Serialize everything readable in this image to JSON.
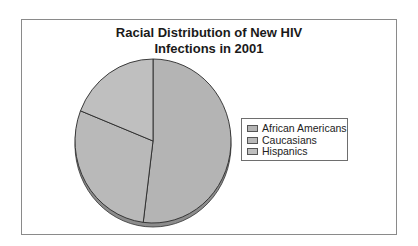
{
  "chart_data": {
    "type": "pie",
    "title": "Racial Distribution of New HIV Infections in 2001",
    "title_lines": [
      "Racial Distribution of New HIV",
      "Infections in 2001"
    ],
    "categories": [
      "African Americans",
      "Caucasians",
      "Hispanics"
    ],
    "values": [
      52,
      29,
      19
    ],
    "units": "percent (estimated from slice angles)",
    "start_angle_deg": 0,
    "direction": "clockwise",
    "colors": [
      "#b4b4b4",
      "#b9b9b9",
      "#bfbfbf"
    ],
    "legend_position": "right",
    "style": "3D pie with shadow rim"
  },
  "legend": {
    "items": [
      {
        "label": "African Americans",
        "color": "#b4b4b4"
      },
      {
        "label": "Caucasians",
        "color": "#b9b9b9"
      },
      {
        "label": "Hispanics",
        "color": "#bfbfbf"
      }
    ]
  }
}
